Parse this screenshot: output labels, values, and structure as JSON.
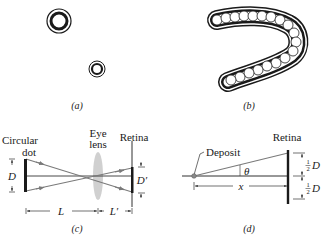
{
  "panels": {
    "a": {
      "caption": "(a)"
    },
    "b": {
      "caption": "(b)"
    },
    "c": {
      "caption": "(c)",
      "labels": {
        "circular_dot_line1": "Circular",
        "circular_dot_line2": "dot",
        "eye_lens_line1": "Eye",
        "eye_lens_line2": "lens",
        "retina": "Retina",
        "D": "D",
        "D_prime": "D′",
        "L": "L",
        "L_prime": "L′"
      }
    },
    "d": {
      "caption": "(d)",
      "labels": {
        "deposit": "Deposit",
        "retina": "Retina",
        "theta": "θ",
        "x": "x",
        "half_num": "1",
        "half_den": "2",
        "D_upper": "D",
        "D_lower": "D"
      }
    }
  },
  "colors": {
    "ink": "#1a1a1a",
    "ray": "#7a7a7a",
    "lens": "#c8c8c8"
  }
}
